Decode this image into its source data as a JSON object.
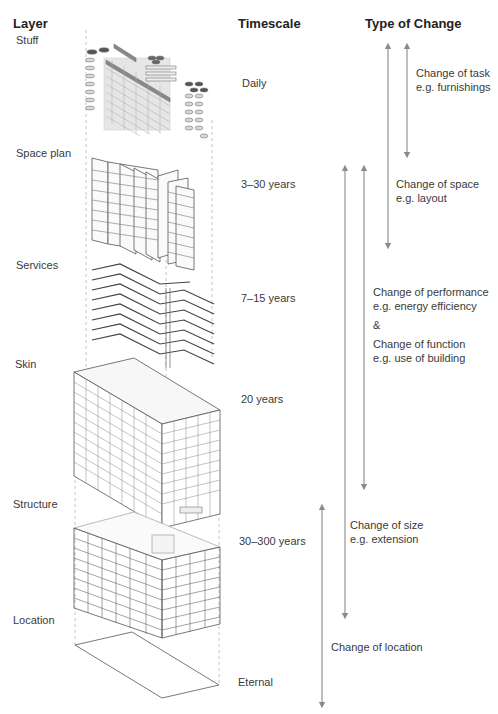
{
  "headers": {
    "layer": "Layer",
    "timescale": "Timescale",
    "type_of_change": "Type of Change"
  },
  "layers": [
    {
      "name": "Stuff",
      "timescale": "Daily"
    },
    {
      "name": "Space plan",
      "timescale": "3–30 years"
    },
    {
      "name": "Services",
      "timescale": "7–15 years"
    },
    {
      "name": "Skin",
      "timescale": "20 years"
    },
    {
      "name": "Structure",
      "timescale": "30–300 years"
    },
    {
      "name": "Location",
      "timescale": "Eternal"
    }
  ],
  "changes": [
    {
      "title": "Change of task",
      "example": "e.g. furnishings"
    },
    {
      "title": "Change of space",
      "example": "e.g. layout"
    },
    {
      "title": "Change of performance",
      "example": "e.g. energy efficiency"
    },
    {
      "ampersand": "&"
    },
    {
      "title": "Change of function",
      "example": "e.g. use of building"
    },
    {
      "title": "Change of size",
      "example": "e.g. extension"
    },
    {
      "title": "Change of location"
    }
  ],
  "colors": {
    "arrow": "#8a8a8a",
    "drawing": "#555555",
    "drawing_light": "#b5b5b5",
    "text": "#3a3a3a"
  }
}
